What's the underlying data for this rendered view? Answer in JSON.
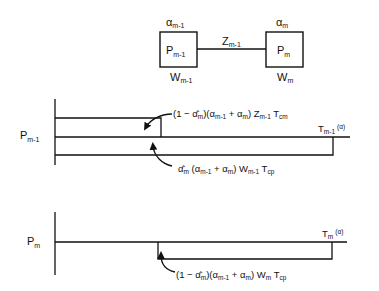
{
  "network": {
    "left_node": {
      "label": "P",
      "label_sub": "m-1",
      "top": "α",
      "top_sub": "m-1",
      "bottom": "W",
      "bottom_sub": "m-1"
    },
    "right_node": {
      "label": "P",
      "label_sub": "m",
      "top": "α",
      "top_sub": "m",
      "bottom": "W",
      "bottom_sub": "m"
    },
    "link": {
      "label": "Z",
      "label_sub": "m-1"
    }
  },
  "timeline_upper": {
    "axis_label": "P",
    "axis_sub": "m-1",
    "end_label": "T",
    "end_sub": "m-1",
    "end_suffix": "(α)",
    "annotation_top": {
      "parts": [
        "(1 − ",
        "α̂",
        "m",
        ")(α",
        "m-1",
        " + α",
        "m",
        ") Z",
        "m-1",
        " T",
        "cm"
      ]
    },
    "annotation_bottom": {
      "parts": [
        "α̂",
        "m",
        " (α",
        "m-1",
        " + α",
        "m",
        ") W",
        "m-1",
        " T",
        "cp"
      ]
    }
  },
  "timeline_lower": {
    "axis_label": "P",
    "axis_sub": "m",
    "end_label": "T",
    "end_sub": "m",
    "end_suffix": "(α)",
    "annotation": {
      "parts": [
        "(1 − ",
        "α̂",
        "m",
        ")(α",
        "m-1",
        " + α",
        "m",
        ") W",
        "m",
        " T",
        "cp"
      ]
    }
  }
}
